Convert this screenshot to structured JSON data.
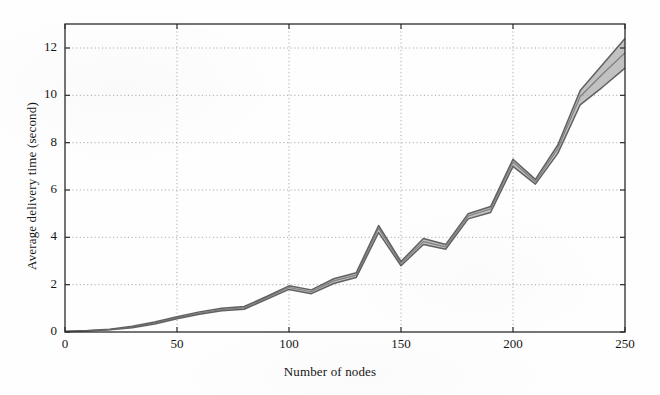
{
  "figure": {
    "background_color": "#fefefe",
    "axis_color": "#2b2b2b",
    "grid_color": "#8d8d8d",
    "line_color": "#5a5a5a",
    "band_color": "#9b9b9b"
  },
  "chart_data": {
    "type": "line",
    "title": "",
    "subtitle": "",
    "xlabel": "Number of nodes",
    "ylabel": "Average delivery time (second)",
    "xlim": [
      0,
      250
    ],
    "ylim": [
      0,
      13
    ],
    "xticks": [
      0,
      50,
      100,
      150,
      200,
      250
    ],
    "yticks": [
      0,
      2,
      4,
      6,
      8,
      10,
      12
    ],
    "xtick_labels": [
      "0",
      "50",
      "100",
      "150",
      "200",
      "250"
    ],
    "ytick_labels": [
      "0",
      "2",
      "4",
      "6",
      "8",
      "10",
      "12"
    ],
    "grid": true,
    "grid_style": "dotted",
    "legend": null,
    "legend_position": "none",
    "annotations": [],
    "x": [
      0,
      10,
      20,
      30,
      40,
      50,
      60,
      70,
      80,
      90,
      100,
      110,
      120,
      130,
      140,
      150,
      160,
      170,
      180,
      190,
      200,
      210,
      220,
      230,
      240,
      250
    ],
    "series": [
      {
        "name": "upper bound",
        "values": [
          0.03,
          0.06,
          0.12,
          0.24,
          0.42,
          0.64,
          0.85,
          1.0,
          1.08,
          1.5,
          1.95,
          1.78,
          2.25,
          2.5,
          4.5,
          2.98,
          3.95,
          3.7,
          5.0,
          5.3,
          7.3,
          6.45,
          7.9,
          10.2,
          11.3,
          12.4
        ]
      },
      {
        "name": "mean",
        "values": [
          0.02,
          0.05,
          0.1,
          0.21,
          0.38,
          0.6,
          0.8,
          0.95,
          1.02,
          1.44,
          1.88,
          1.7,
          2.16,
          2.4,
          4.38,
          2.9,
          3.82,
          3.6,
          4.9,
          5.2,
          7.18,
          6.35,
          7.75,
          9.95,
          10.9,
          11.8
        ]
      },
      {
        "name": "lower bound",
        "values": [
          0.01,
          0.04,
          0.09,
          0.18,
          0.34,
          0.56,
          0.75,
          0.9,
          0.96,
          1.38,
          1.8,
          1.62,
          2.05,
          2.3,
          4.2,
          2.8,
          3.7,
          3.5,
          4.78,
          5.05,
          7.0,
          6.25,
          7.55,
          9.6,
          10.35,
          11.15
        ]
      }
    ]
  }
}
